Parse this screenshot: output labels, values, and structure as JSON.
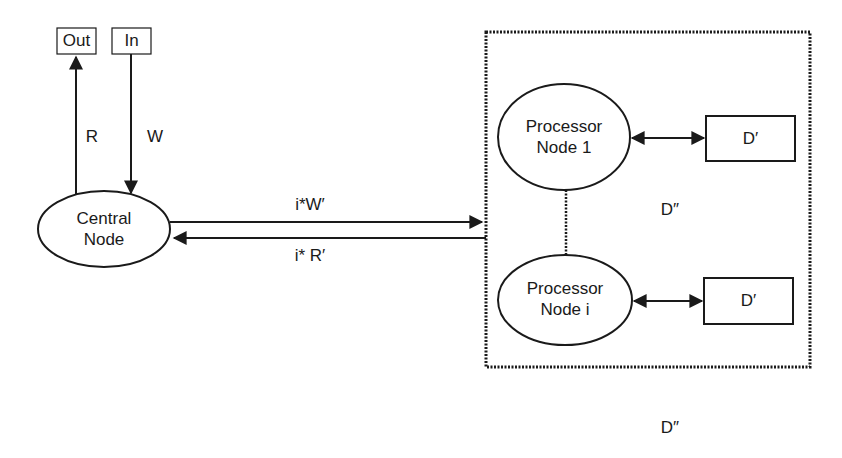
{
  "diagram": {
    "io": {
      "out_label": "Out",
      "in_label": "In"
    },
    "edges": {
      "read_label": "R",
      "write_label": "W",
      "forward_label": "i*W′",
      "backward_label": "i* R′"
    },
    "nodes": {
      "central": {
        "line1": "Central",
        "line2": "Node"
      },
      "processor_1": {
        "line1": "Processor",
        "line2": "Node 1"
      },
      "processor_i": {
        "line1": "Processor",
        "line2": "Node i"
      }
    },
    "storage": {
      "d_prime_1": "D′",
      "d_prime_i": "D′",
      "d_double_prime_inside": "D″",
      "d_double_prime_below": "D″"
    }
  }
}
